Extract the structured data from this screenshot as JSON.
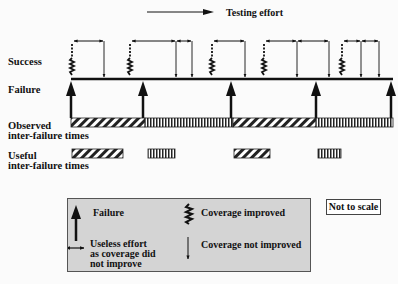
{
  "header": {
    "testing_effort_label": "Testing effort"
  },
  "row_labels": {
    "success": "Success",
    "failure": "Failure",
    "observed_line1": "Observed",
    "observed_line2": "inter-failure times",
    "useful_line1": "Useful",
    "useful_line2": "inter-failure times"
  },
  "legend": {
    "failure": "Failure",
    "coverage_improved": "Coverage improved",
    "useless_line1": "Useless effort",
    "useless_line2": "as coverage did",
    "useless_line3": "not improve",
    "coverage_not_improved": "Coverage not improved"
  },
  "note": "Not to scale",
  "diagram": {
    "timeline": {
      "x1": 71,
      "x2": 393,
      "y": 79
    },
    "failure_arrows_x": [
      71,
      143,
      231,
      316,
      391
    ],
    "coverage_improved_x": [
      72,
      130,
      212,
      264,
      342
    ],
    "coverage_not_improved_x": [
      104,
      176,
      192,
      245,
      297,
      329,
      361,
      379
    ],
    "useless_effort_spans": [
      [
        73,
        104
      ],
      [
        131,
        176
      ],
      [
        176,
        192
      ],
      [
        213,
        245
      ],
      [
        265,
        297
      ],
      [
        297,
        329
      ],
      [
        343,
        361
      ],
      [
        361,
        379
      ]
    ],
    "observed_segments": [
      {
        "x1": 71,
        "x2": 145,
        "pattern": "diagonal"
      },
      {
        "x1": 145,
        "x2": 233,
        "pattern": "vertical"
      },
      {
        "x1": 233,
        "x2": 316,
        "pattern": "diagonal"
      },
      {
        "x1": 316,
        "x2": 393,
        "pattern": "vertical"
      }
    ],
    "useful_segments": [
      {
        "x1": 72,
        "x2": 123,
        "pattern": "diagonal"
      },
      {
        "x1": 148,
        "x2": 175,
        "pattern": "vertical"
      },
      {
        "x1": 234,
        "x2": 270,
        "pattern": "diagonal"
      },
      {
        "x1": 318,
        "x2": 341,
        "pattern": "vertical"
      }
    ]
  }
}
